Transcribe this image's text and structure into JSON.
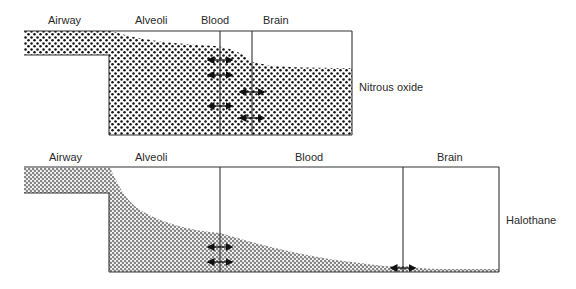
{
  "top_panel": {
    "labels": {
      "airway": "Airway",
      "alveoli": "Alveoli",
      "blood": "Blood",
      "brain": "Brain"
    },
    "agent": "Nitrous oxide"
  },
  "bottom_panel": {
    "labels": {
      "airway": "Airway",
      "alveoli": "Alveoli",
      "blood": "Blood",
      "brain": "Brain"
    },
    "agent": "Halothane"
  },
  "colors": {
    "line": "#333333",
    "dot_solid": "#111111",
    "dot_open": "#333333",
    "background": "#ffffff"
  }
}
